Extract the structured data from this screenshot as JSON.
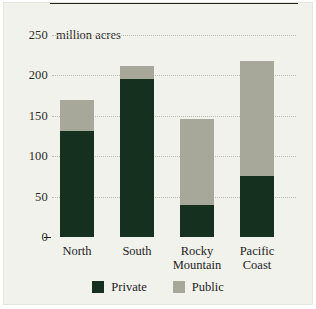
{
  "chart_data": {
    "type": "bar",
    "stacked": true,
    "unit_label": "million acres",
    "xlabel": "",
    "ylabel": "",
    "ylim": [
      0,
      250
    ],
    "yticks": [
      0,
      50,
      100,
      150,
      200,
      250
    ],
    "ytick_labels": [
      "0",
      "50",
      "100",
      "150",
      "200",
      "250"
    ],
    "grid": true,
    "grid_style": "dotted-horizontal",
    "legend_position": "bottom-center",
    "categories": [
      "North",
      "South",
      "Rocky Mountain",
      "Pacific Coast"
    ],
    "category_lines": [
      [
        "North"
      ],
      [
        "South"
      ],
      [
        "Rocky",
        "Mountain"
      ],
      [
        "Pacific",
        "Coast"
      ]
    ],
    "series": [
      {
        "name": "Private",
        "color": "#16301f",
        "values": [
          131,
          195,
          39,
          76
        ]
      },
      {
        "name": "Public",
        "color": "#a8a89a",
        "values": [
          39,
          17,
          107,
          142
        ]
      }
    ],
    "totals": [
      170,
      212,
      146,
      218
    ],
    "colors": {
      "private": "#16301f",
      "public": "#a8a89a",
      "panel_background": "#f2f2ec",
      "page_background": "#ffffff",
      "axis": "#23231f",
      "gridline": "#b9b9ae",
      "text": "#23231f"
    }
  },
  "legend": {
    "items": [
      {
        "label": "Private"
      },
      {
        "label": "Public"
      }
    ]
  }
}
